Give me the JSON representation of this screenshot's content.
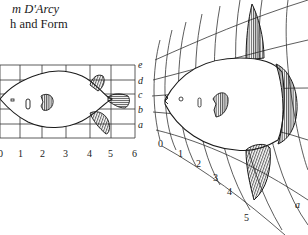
{
  "caption": {
    "line1": "m D'Arcy",
    "line2": "h and Form"
  },
  "left_figure": {
    "name": "Orthogonal grid fish (Diodon / porcupine-fish outline)",
    "x_labels": [
      "0",
      "1",
      "2",
      "3",
      "4",
      "5",
      "6"
    ],
    "y_labels": [
      "e",
      "d",
      "c",
      "b",
      "a"
    ]
  },
  "right_figure": {
    "name": "Transformed grid fish (Orthagoriscus / sunfish)",
    "radial_labels": [
      "0",
      "1",
      "2",
      "3",
      "4",
      "5"
    ],
    "curve_label": "a"
  },
  "colors": {
    "ink": "#1a1a1a",
    "background": "#ffffff"
  }
}
